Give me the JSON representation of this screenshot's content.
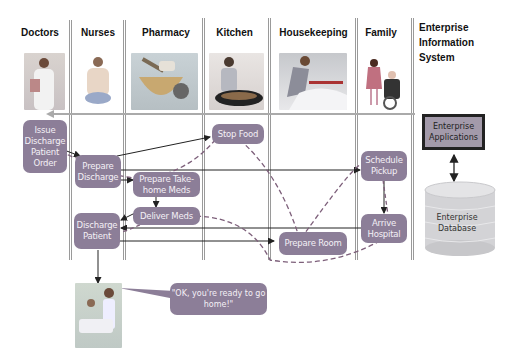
{
  "lanes": [
    {
      "id": "doctors",
      "label": "Doctors"
    },
    {
      "id": "nurses",
      "label": "Nurses"
    },
    {
      "id": "pharmacy",
      "label": "Pharmacy"
    },
    {
      "id": "kitchen",
      "label": "Kitchen"
    },
    {
      "id": "housekeeping",
      "label": "Housekeeping"
    },
    {
      "id": "family",
      "label": "Family"
    }
  ],
  "eis": {
    "title_line1": "Enterprise",
    "title_line2": "Information",
    "title_line3": "System",
    "applications": "Enterprise Applications",
    "database_line1": "Enterprise",
    "database_line2": "Database"
  },
  "tasks": {
    "issue_discharge": "Issue Discharge Patient Order",
    "prepare_discharge": "Prepare Discharge",
    "prepare_takehome": "Prepare Take-home Meds",
    "deliver_meds": "Deliver Meds",
    "discharge_patient": "Discharge Patient",
    "stop_food": "Stop Food",
    "prepare_room": "Prepare Room",
    "schedule_pickup": "Schedule Pickup",
    "arrive_hospital": "Arrive Hospital"
  },
  "speech_bubble": "\"OK, you're ready to go home!\"",
  "colors": {
    "task_box": "#8c7e98",
    "lane_line": "#9a9a9a",
    "arrow": "#222222"
  }
}
